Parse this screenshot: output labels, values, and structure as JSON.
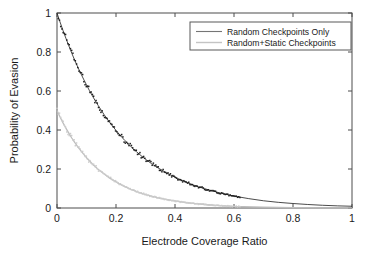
{
  "chart_data": {
    "type": "line",
    "title": "",
    "xlabel": "Electrode Coverage Ratio",
    "ylabel": "Probability of Evasion",
    "xlim": [
      0,
      1
    ],
    "ylim": [
      0,
      1
    ],
    "xticks": [
      "0",
      "0.2",
      "0.4",
      "0.6",
      "0.8",
      "1"
    ],
    "xtick_values": [
      0,
      0.2,
      0.4,
      0.6,
      0.8,
      1
    ],
    "yticks": [
      "0",
      "0.2",
      "0.4",
      "0.6",
      "0.8",
      "1"
    ],
    "ytick_values": [
      0,
      0.2,
      0.4,
      0.6,
      0.8,
      1
    ],
    "grid": false,
    "legend_position": "top-right",
    "series": [
      {
        "name": "Random Checkpoints Only",
        "color": "#2b2b2b",
        "style": "line-with-scatter",
        "x": [
          0,
          0.01,
          0.02,
          0.03,
          0.04,
          0.05,
          0.06,
          0.07,
          0.08,
          0.09,
          0.1,
          0.11,
          0.12,
          0.13,
          0.14,
          0.15,
          0.16,
          0.17,
          0.18,
          0.19,
          0.2,
          0.21,
          0.22,
          0.23,
          0.24,
          0.25,
          0.26,
          0.27,
          0.28,
          0.29,
          0.3,
          0.31,
          0.32,
          0.33,
          0.34,
          0.35,
          0.36,
          0.37,
          0.38,
          0.39,
          0.4,
          0.42,
          0.44,
          0.46,
          0.48,
          0.5,
          0.55,
          0.6,
          0.65,
          0.7,
          0.75,
          0.8,
          0.85,
          0.9,
          0.95,
          1.0
        ],
        "values": [
          1.0,
          0.955,
          0.912,
          0.871,
          0.832,
          0.794,
          0.758,
          0.724,
          0.692,
          0.661,
          0.631,
          0.602,
          0.575,
          0.549,
          0.525,
          0.501,
          0.478,
          0.457,
          0.436,
          0.417,
          0.398,
          0.38,
          0.363,
          0.346,
          0.331,
          0.316,
          0.301,
          0.288,
          0.275,
          0.262,
          0.25,
          0.239,
          0.228,
          0.218,
          0.208,
          0.199,
          0.19,
          0.181,
          0.173,
          0.165,
          0.158,
          0.144,
          0.131,
          0.119,
          0.109,
          0.099,
          0.078,
          0.061,
          0.048,
          0.037,
          0.029,
          0.023,
          0.018,
          0.014,
          0.011,
          0.009
        ]
      },
      {
        "name": "Random+Static Checkpoints",
        "color": "#bdbdbd",
        "style": "line-with-scatter",
        "x": [
          0,
          0.01,
          0.02,
          0.03,
          0.04,
          0.05,
          0.06,
          0.07,
          0.08,
          0.09,
          0.1,
          0.11,
          0.12,
          0.13,
          0.14,
          0.15,
          0.16,
          0.17,
          0.18,
          0.19,
          0.2,
          0.21,
          0.22,
          0.23,
          0.24,
          0.25,
          0.26,
          0.27,
          0.28,
          0.29,
          0.3,
          0.31,
          0.32,
          0.33,
          0.34,
          0.35,
          0.36,
          0.37,
          0.38,
          0.39,
          0.4,
          0.42,
          0.44,
          0.46,
          0.48,
          0.5,
          0.55,
          0.6,
          0.7,
          0.8,
          0.9,
          1.0
        ],
        "values": [
          0.5,
          0.468,
          0.438,
          0.41,
          0.384,
          0.359,
          0.336,
          0.315,
          0.295,
          0.276,
          0.258,
          0.242,
          0.226,
          0.212,
          0.198,
          0.186,
          0.174,
          0.163,
          0.152,
          0.143,
          0.134,
          0.125,
          0.117,
          0.11,
          0.103,
          0.096,
          0.09,
          0.084,
          0.079,
          0.074,
          0.069,
          0.065,
          0.061,
          0.057,
          0.053,
          0.05,
          0.047,
          0.044,
          0.041,
          0.038,
          0.036,
          0.031,
          0.027,
          0.024,
          0.021,
          0.018,
          0.012,
          0.008,
          0.004,
          0.002,
          0.001,
          0.0005
        ]
      }
    ]
  },
  "legend": {
    "entries": [
      {
        "label": "Random Checkpoints Only",
        "color": "#757575"
      },
      {
        "label": "Random+Static Checkpoints",
        "color": "#c4c4c4"
      }
    ]
  },
  "axes": {
    "x_title": "Electrode Coverage Ratio",
    "y_title": "Probability of Evasion"
  }
}
